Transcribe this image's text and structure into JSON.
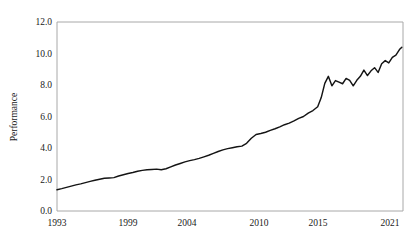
{
  "chart_data": {
    "type": "line",
    "title": "",
    "subtitle": "",
    "xlabel": "",
    "ylabel": "Performance",
    "xlim": [
      1993,
      2022.2
    ],
    "ylim": [
      0.0,
      12.0
    ],
    "grid": false,
    "legend": null,
    "legend_position": "none",
    "line_color": "#141414",
    "axis_color": "#a8a8a8",
    "background_color": "#ffffff",
    "yticks": [
      0.0,
      2.0,
      4.0,
      6.0,
      8.0,
      10.0,
      12.0
    ],
    "ytick_labels": [
      "0.0",
      "2.0",
      "4.0",
      "6.0",
      "8.0",
      "10.0",
      "12.0"
    ],
    "xticks": [
      1993,
      1999,
      2004,
      2010,
      2015,
      2021
    ],
    "xtick_labels": [
      "1993",
      "1999",
      "2004",
      "2010",
      "2015",
      "2021"
    ],
    "series": [
      {
        "name": "Performance",
        "x": [
          1993.0,
          1993.4,
          1993.8,
          1994.2,
          1994.6,
          1995.0,
          1995.4,
          1995.8,
          1996.2,
          1996.6,
          1997.0,
          1997.4,
          1997.8,
          1998.2,
          1998.6,
          1999.0,
          1999.4,
          1999.8,
          2000.2,
          2000.6,
          2001.0,
          2001.4,
          2001.8,
          2002.2,
          2002.6,
          2003.0,
          2003.4,
          2003.8,
          2004.2,
          2004.6,
          2005.0,
          2005.4,
          2005.8,
          2006.2,
          2006.6,
          2007.0,
          2007.4,
          2007.8,
          2008.2,
          2008.6,
          2009.0,
          2009.4,
          2009.8,
          2010.2,
          2010.6,
          2011.0,
          2011.4,
          2011.8,
          2012.2,
          2012.6,
          2013.0,
          2013.4,
          2013.8,
          2014.2,
          2014.6,
          2015.0,
          2015.3,
          2015.6,
          2015.9,
          2016.2,
          2016.5,
          2016.8,
          2017.1,
          2017.4,
          2017.7,
          2018.0,
          2018.3,
          2018.6,
          2018.9,
          2019.2,
          2019.5,
          2019.8,
          2020.1,
          2020.4,
          2020.7,
          2021.0,
          2021.3,
          2021.6,
          2021.9,
          2022.1
        ],
        "y": [
          1.35,
          1.42,
          1.5,
          1.58,
          1.66,
          1.72,
          1.8,
          1.88,
          1.95,
          2.02,
          2.08,
          2.1,
          2.12,
          2.22,
          2.3,
          2.38,
          2.44,
          2.52,
          2.58,
          2.62,
          2.64,
          2.66,
          2.62,
          2.68,
          2.8,
          2.92,
          3.02,
          3.12,
          3.2,
          3.26,
          3.34,
          3.44,
          3.54,
          3.66,
          3.78,
          3.88,
          3.96,
          4.02,
          4.08,
          4.12,
          4.3,
          4.62,
          4.86,
          4.92,
          5.0,
          5.12,
          5.22,
          5.34,
          5.48,
          5.58,
          5.72,
          5.88,
          6.0,
          6.22,
          6.38,
          6.62,
          7.2,
          8.1,
          8.55,
          7.95,
          8.28,
          8.18,
          8.08,
          8.42,
          8.3,
          7.95,
          8.3,
          8.55,
          8.95,
          8.6,
          8.9,
          9.1,
          8.8,
          9.35,
          9.55,
          9.4,
          9.75,
          9.9,
          10.25,
          10.4
        ]
      }
    ]
  }
}
